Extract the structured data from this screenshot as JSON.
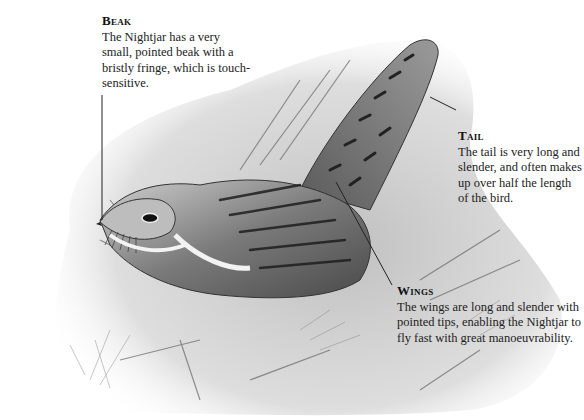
{
  "subject": "Nightjar",
  "annotations": [
    {
      "id": "beak",
      "title": "Beak",
      "text": "The Nightjar has a very small, pointed beak with a bristly fringe, which is touch-sensitive."
    },
    {
      "id": "tail",
      "title": "Tail",
      "text": "The tail is very long and slender, and often makes up over half the length of the bird."
    },
    {
      "id": "wings",
      "title": "Wings",
      "text": "The wings are long and slender with pointed tips, enabling the Nightjar to fly fast with great manoeuvrability."
    }
  ],
  "colors": {
    "background": "#ffffff",
    "text": "#1a1a1a",
    "leader_line": "#222222"
  }
}
